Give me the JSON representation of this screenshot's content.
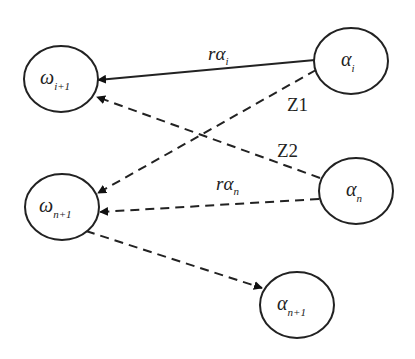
{
  "diagram": {
    "nodes": [
      {
        "id": "omega_i1",
        "symbol": "ω",
        "sub": "i+1"
      },
      {
        "id": "alpha_i",
        "symbol": "α",
        "sub": "i"
      },
      {
        "id": "alpha_n",
        "symbol": "α",
        "sub": "n"
      },
      {
        "id": "omega_n1",
        "symbol": "ω",
        "sub": "n+1"
      },
      {
        "id": "alpha_n1",
        "symbol": "α",
        "sub": "n+1"
      }
    ],
    "edges": [
      {
        "from": "alpha_i",
        "to": "omega_i1",
        "style": "solid",
        "label": "rα",
        "label_sub": "i"
      },
      {
        "from": "alpha_i",
        "to": "omega_n1",
        "style": "dashed",
        "label": "Z1"
      },
      {
        "from": "alpha_n",
        "to": "omega_i1",
        "style": "dashed",
        "label": "Z2"
      },
      {
        "from": "alpha_n",
        "to": "omega_n1",
        "style": "dashed",
        "label": "rα",
        "label_sub": "n"
      },
      {
        "from": "omega_n1",
        "to": "alpha_n1",
        "style": "dashed",
        "label": ""
      }
    ],
    "colors": {
      "stroke": "#222222",
      "background": "#ffffff"
    }
  }
}
